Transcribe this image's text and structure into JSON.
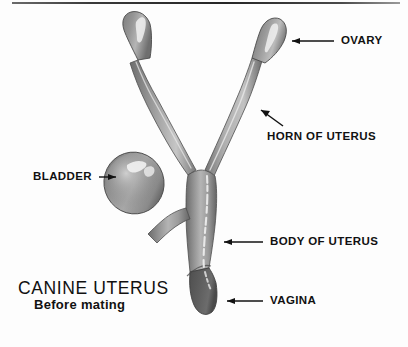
{
  "figure": {
    "title": "CANINE UTERUS",
    "subtitle": "Before mating",
    "background_color": "#fdfdfd",
    "rule_color": "#2b2b2b",
    "ink_color": "#111111",
    "tissue_color_mid": "#8d8d8d",
    "tissue_color_dark": "#5a5a5a",
    "tissue_color_light": "#c9c9c9",
    "highlight_color": "#f2f2f2"
  },
  "labels": [
    {
      "id": "ovary",
      "text": "OVARY",
      "arrow": "arrow-left-icon"
    },
    {
      "id": "horn-of-uterus",
      "text": "HORN OF UTERUS",
      "arrow": "arrow-diagonal-up-left-icon"
    },
    {
      "id": "bladder",
      "text": "BLADDER",
      "arrow": "arrow-right-icon"
    },
    {
      "id": "body-of-uterus",
      "text": "BODY OF UTERUS",
      "arrow": "arrow-left-icon"
    },
    {
      "id": "vagina",
      "text": "VAGINA",
      "arrow": "arrow-left-icon"
    }
  ],
  "anatomy": [
    {
      "id": "ovary-left",
      "name": "left ovary"
    },
    {
      "id": "ovary-right",
      "name": "right ovary"
    },
    {
      "id": "horn-left",
      "name": "left horn of uterus"
    },
    {
      "id": "horn-right",
      "name": "right horn of uterus"
    },
    {
      "id": "body",
      "name": "body of uterus"
    },
    {
      "id": "bladder-sac",
      "name": "bladder"
    },
    {
      "id": "vagina-segment",
      "name": "vagina"
    }
  ]
}
